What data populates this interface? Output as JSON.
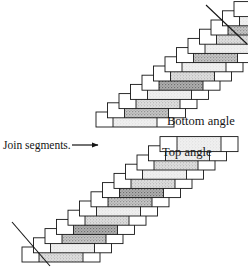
{
  "figure": {
    "background_color": "#ffffff",
    "ink_color": "#151515"
  },
  "labels": {
    "bottom_angle": "Bottom angle",
    "top_angle": "Top angle",
    "join_segments": "Join segments."
  },
  "annotations": {
    "arrow": {
      "name": "join-segments-arrow",
      "direction": "right",
      "x1": 72,
      "y1": 145,
      "x2": 98,
      "y2": 145
    }
  },
  "colors": {
    "outline": "#151515",
    "white_cap": "#ffffff",
    "fill_light": "#efefef",
    "fill_medium": "#d9d9d9",
    "fill_dark": "#bdbdbd",
    "fill_darkest": "#a8a8a8"
  },
  "geometry": {
    "bar_width": 78,
    "bar_height": 15,
    "cap_width": 17,
    "step_dx": 11.5,
    "step_dy": -9.2
  },
  "assemblies": [
    {
      "name": "upper-assembly",
      "label_ref": "bottom_angle",
      "angle_cut": "top-right",
      "origin": {
        "x": 96,
        "y": 112
      },
      "cut_line": {
        "x1": 206,
        "y1": 5,
        "x2": 247,
        "y2": 44
      },
      "segments": [
        {
          "index": 0,
          "fill": "fill_light"
        },
        {
          "index": 1,
          "fill": "fill_dark"
        },
        {
          "index": 2,
          "fill": "fill_medium"
        },
        {
          "index": 3,
          "fill": "fill_light"
        },
        {
          "index": 4,
          "fill": "fill_darkest"
        },
        {
          "index": 5,
          "fill": "fill_medium"
        },
        {
          "index": 6,
          "fill": "fill_light"
        },
        {
          "index": 7,
          "fill": "fill_dark"
        },
        {
          "index": 8,
          "fill": "fill_light"
        },
        {
          "index": 9,
          "fill": "fill_medium"
        },
        {
          "index": 10,
          "fill": "fill_dark"
        },
        {
          "index": 11,
          "fill": "fill_light"
        },
        {
          "index": 12,
          "fill": "fill_medium"
        }
      ]
    },
    {
      "name": "lower-assembly",
      "label_ref": "top_angle",
      "angle_cut": "bottom-left",
      "origin": {
        "x": 22,
        "y": 247
      },
      "cut_line": {
        "x1": 12,
        "y1": 222,
        "x2": 50,
        "y2": 266
      },
      "segments": [
        {
          "index": 0,
          "fill": "fill_medium"
        },
        {
          "index": 1,
          "fill": "fill_light"
        },
        {
          "index": 2,
          "fill": "fill_dark"
        },
        {
          "index": 3,
          "fill": "fill_darkest"
        },
        {
          "index": 4,
          "fill": "fill_medium"
        },
        {
          "index": 5,
          "fill": "fill_light"
        },
        {
          "index": 6,
          "fill": "fill_dark"
        },
        {
          "index": 7,
          "fill": "fill_darkest"
        },
        {
          "index": 8,
          "fill": "fill_medium"
        },
        {
          "index": 9,
          "fill": "fill_light"
        },
        {
          "index": 10,
          "fill": "fill_medium"
        },
        {
          "index": 11,
          "fill": "fill_light"
        },
        {
          "index": 12,
          "fill": "fill_light"
        }
      ]
    }
  ]
}
